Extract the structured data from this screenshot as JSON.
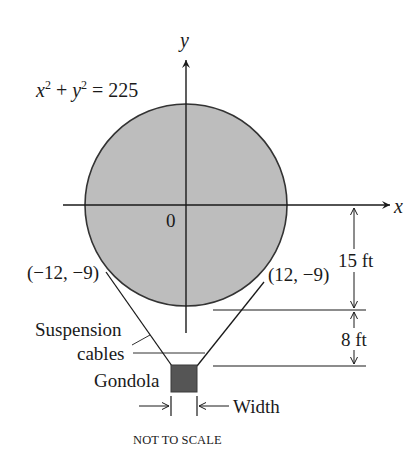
{
  "figure": {
    "equation": {
      "x_var": "x",
      "x_exp": "2",
      "plus": " + ",
      "y_var": "y",
      "y_exp": "2",
      "rhs": " = 225"
    },
    "axes": {
      "x_label": "x",
      "y_label": "y",
      "origin_label": "0"
    },
    "points": {
      "left": "(−12, −9)",
      "right": "(12, −9)"
    },
    "dimensions": {
      "upper": "15 ft",
      "lower": "8 ft",
      "width": "Width"
    },
    "callouts": {
      "suspension_line1": "Suspension",
      "suspension_line2": "cables",
      "gondola": "Gondola"
    },
    "note": "NOT TO SCALE",
    "colors": {
      "balloon_fill": "#bdbdbd",
      "gondola_fill": "#555555",
      "stroke": "#1a1a1a"
    }
  }
}
